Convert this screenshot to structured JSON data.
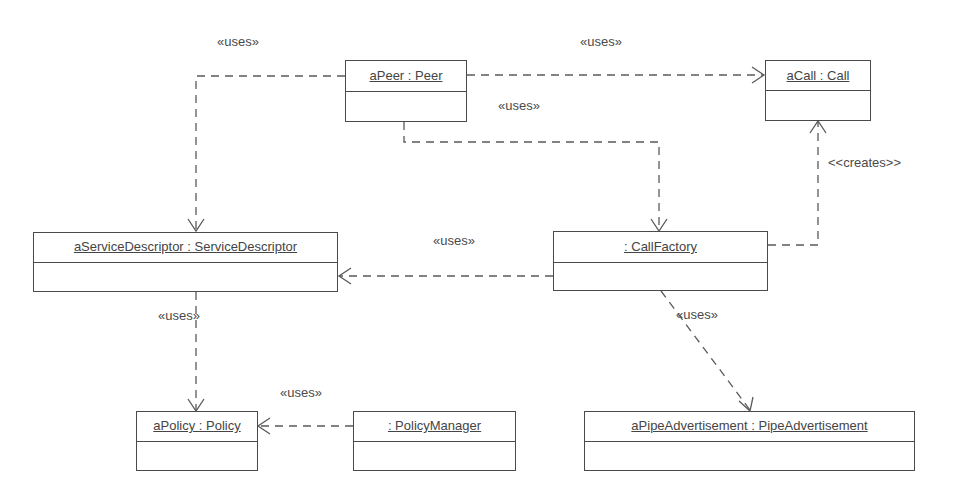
{
  "diagram": {
    "type": "UML object diagram",
    "objects": [
      {
        "id": "aPeer",
        "name": "aPeer : Peer",
        "x": 345,
        "y": 60,
        "w": 122,
        "h": 62,
        "div": 32
      },
      {
        "id": "aCall",
        "name": "aCall : Call",
        "x": 765,
        "y": 60,
        "w": 106,
        "h": 61,
        "div": 31
      },
      {
        "id": "aServiceDescriptor",
        "name": "aServiceDescriptor : ServiceDescriptor",
        "x": 33,
        "y": 232,
        "w": 305,
        "h": 60,
        "div": 31
      },
      {
        "id": "callFactory",
        "name": ": CallFactory",
        "x": 553,
        "y": 231,
        "w": 215,
        "h": 60,
        "div": 32
      },
      {
        "id": "aPolicy",
        "name": "aPolicy : Policy",
        "x": 136,
        "y": 411,
        "w": 122,
        "h": 60,
        "div": 31
      },
      {
        "id": "policyManager",
        "name": ": PolicyManager",
        "x": 353,
        "y": 411,
        "w": 163,
        "h": 60,
        "div": 31
      },
      {
        "id": "aPipeAdvertisement",
        "name": "aPipeAdvertisement : PipeAdvertisement",
        "x": 584,
        "y": 411,
        "w": 331,
        "h": 60,
        "div": 31
      }
    ],
    "relations": [
      {
        "from": "aPeer",
        "to": "aServiceDescriptor",
        "stereotype": "«uses»",
        "label_x": 217,
        "label_y": 35
      },
      {
        "from": "aPeer",
        "to": "aCall",
        "stereotype": "«uses»",
        "label_x": 580,
        "label_y": 35
      },
      {
        "from": "aPeer",
        "to": "callFactory",
        "stereotype": "«uses»",
        "label_x": 498,
        "label_y": 99
      },
      {
        "from": "callFactory",
        "to": "aCall",
        "stereotype": "<<creates>>",
        "label_x": 828,
        "label_y": 156
      },
      {
        "from": "callFactory",
        "to": "aServiceDescriptor",
        "stereotype": "«uses»",
        "label_x": 433,
        "label_y": 234
      },
      {
        "from": "aServiceDescriptor",
        "to": "aPolicy",
        "stereotype": "«uses»",
        "label_x": 158,
        "label_y": 309
      },
      {
        "from": "policyManager",
        "to": "aPolicy",
        "stereotype": "«uses»",
        "label_x": 280,
        "label_y": 386
      },
      {
        "from": "callFactory",
        "to": "aPipeAdvertisement",
        "stereotype": "«uses»",
        "label_x": 676,
        "label_y": 308
      }
    ]
  },
  "labels": {
    "l0": "«uses»",
    "l1": "«uses»",
    "l2": "«uses»",
    "l3": "<<creates>>",
    "l4": "«uses»",
    "l5": "«uses»",
    "l6": "«uses»",
    "l7": "«uses»"
  },
  "objects": {
    "aPeer": "aPeer : Peer",
    "aCall": "aCall : Call",
    "aServiceDescriptor": "aServiceDescriptor : ServiceDescriptor",
    "callFactory": ": CallFactory",
    "aPolicy": "aPolicy : Policy",
    "policyManager": ": PolicyManager",
    "aPipeAdvertisement": "aPipeAdvertisement : PipeAdvertisement"
  },
  "colors": {
    "line": "#5a5a5a",
    "border": "#4a4a4a",
    "text": "#444444",
    "background": "#ffffff"
  }
}
